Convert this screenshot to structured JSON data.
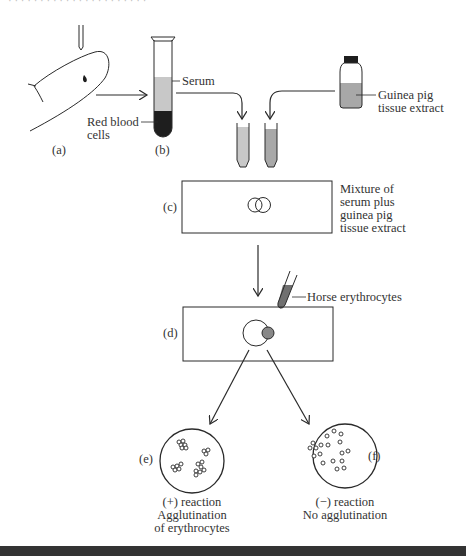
{
  "header": {
    "fragment": "· · · · · · · · · · · · · · · · · · · · · ·"
  },
  "colors": {
    "ink": "#2a2a2a",
    "serum": "#c8c8c8",
    "red_cells": "#1e1e1e",
    "extract": "#a8a8a8",
    "bottle_cap": "#1e1e1e"
  },
  "panels": {
    "a": {
      "label": "(a)"
    },
    "b": {
      "label": "(b)",
      "serum_label": "Serum",
      "cells_label_line1": "Red blood",
      "cells_label_line2": "cells"
    },
    "bottle": {
      "label_line1": "Guinea pig",
      "label_line2": "tissue extract"
    },
    "c": {
      "label": "(c)",
      "desc_line1": "Mixture of",
      "desc_line2": "serum plus",
      "desc_line3": "guinea pig",
      "desc_line4": "tissue extract"
    },
    "d": {
      "label": "(d)",
      "pipette_label": "Horse erythrocytes"
    },
    "e": {
      "label": "(e)",
      "caption_line1": "(+) reaction",
      "caption_line2": "Agglutination",
      "caption_line3": "of erythrocytes"
    },
    "f": {
      "label": "(f)",
      "caption_line1": "(−) reaction",
      "caption_line2": "No agglutination"
    }
  }
}
